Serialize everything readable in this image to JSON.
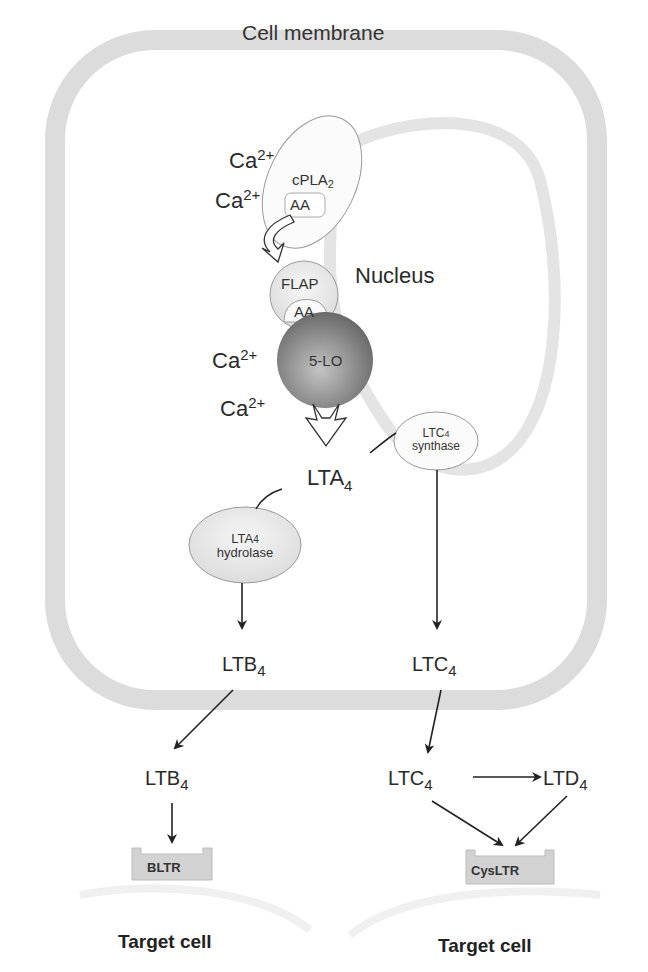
{
  "membrane": {
    "label": "Cell membrane"
  },
  "nucleus": {
    "label": "Nucleus"
  },
  "calcium": {
    "base": "Ca",
    "charge": "2+"
  },
  "enzymes": {
    "cpla2": {
      "base": "cPLA",
      "sub": "2"
    },
    "aa": "AA",
    "flap": "FLAP",
    "five_lo": "5-LO",
    "ltc4_synthase": {
      "base": "LTC",
      "sub": "4",
      "line2": "synthase"
    },
    "lta4_hydrolase": {
      "base": "LTA",
      "sub": "4",
      "line2": "hydrolase"
    }
  },
  "metabolites": {
    "lta4": {
      "base": "LTA",
      "sub": "4"
    },
    "ltb4": {
      "base": "LTB",
      "sub": "4"
    },
    "ltc4": {
      "base": "LTC",
      "sub": "4"
    },
    "ltd4": {
      "base": "LTD",
      "sub": "4"
    }
  },
  "receptors": {
    "bltr": "BLTR",
    "cysltr": "CysLTR"
  },
  "target_cells": {
    "left": "Target cell",
    "right": "Target cell"
  },
  "colors": {
    "membrane": "#dcdcdc",
    "five_lo_dark": "#6e6e6e",
    "five_lo_light": "#b8b8b8",
    "enzyme_fill": "#e8e8e8",
    "receptor_fill": "#d2d2d2",
    "arrow": "#222222"
  }
}
